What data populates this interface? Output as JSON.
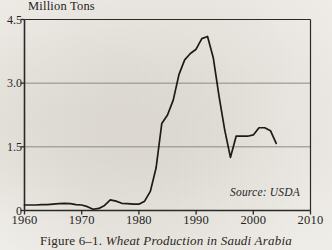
{
  "figure": {
    "caption_label": "Figure 6–1.",
    "caption_title": "Wheat Production in Saudi Arabia",
    "source_note": "Source: USDA",
    "axis_title": "Million Tons"
  },
  "colors": {
    "paper": "#f4f2ee",
    "ink": "#26241f",
    "gridline": "#8c8a86",
    "axis": "#2b2924",
    "series": "#1d1b17"
  },
  "chart_data": {
    "type": "line",
    "title": "Wheat Production in Saudi Arabia",
    "xlabel": "",
    "ylabel": "Million Tons",
    "xlim": [
      1960,
      2010
    ],
    "ylim": [
      0,
      4.5
    ],
    "xticks": [
      1960,
      1970,
      1980,
      1990,
      2000,
      2010
    ],
    "yticks": [
      0,
      1.5,
      3.0,
      4.5
    ],
    "ytick_labels": [
      "0",
      "1.5",
      "3.0",
      "4.5"
    ],
    "grid": "horizontal",
    "gridlines": [
      1.5,
      3.0
    ],
    "legend": "none",
    "annotations": [
      "Source: USDA"
    ],
    "series": [
      {
        "name": "Wheat Production",
        "x": [
          1960,
          1961,
          1962,
          1963,
          1964,
          1965,
          1966,
          1967,
          1968,
          1969,
          1970,
          1971,
          1972,
          1973,
          1974,
          1975,
          1976,
          1977,
          1978,
          1979,
          1980,
          1981,
          1982,
          1983,
          1984,
          1985,
          1986,
          1987,
          1988,
          1989,
          1990,
          1991,
          1992,
          1993,
          1994,
          1995,
          1996,
          1997,
          1998,
          1999,
          2000,
          2001,
          2002,
          2003,
          2004
        ],
        "values": [
          0.13,
          0.13,
          0.13,
          0.14,
          0.14,
          0.15,
          0.16,
          0.17,
          0.16,
          0.14,
          0.13,
          0.09,
          0.03,
          0.05,
          0.12,
          0.25,
          0.22,
          0.17,
          0.16,
          0.15,
          0.15,
          0.22,
          0.45,
          1.0,
          2.05,
          2.25,
          2.6,
          3.2,
          3.55,
          3.7,
          3.8,
          4.05,
          4.1,
          3.6,
          2.7,
          1.9,
          1.25,
          1.75,
          1.75,
          1.75,
          1.78,
          1.95,
          1.95,
          1.88,
          1.58
        ]
      }
    ]
  }
}
